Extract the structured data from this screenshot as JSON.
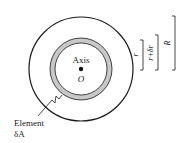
{
  "diagram": {
    "center_label": "Axis",
    "origin_label": "O",
    "element_label_line1": "Element",
    "element_label_line2": "δA",
    "dimensions": {
      "inner": "r",
      "middle": "r+δr",
      "outer": "R"
    },
    "colors": {
      "stroke": "#1a1a1a",
      "annulus_fill": "#c8c8c8",
      "background": "#ffffff"
    }
  }
}
